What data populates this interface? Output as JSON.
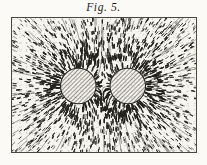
{
  "figure": {
    "caption": "Fig. 5.",
    "title": "Fig. 5.",
    "medium": "engraving",
    "paper_color": "#f7f5ef",
    "ink_color": "#20201c",
    "border_color": "#4a4740"
  },
  "plate": {
    "frame": {
      "x": 11,
      "y": 17,
      "width": 186,
      "height": 136,
      "border_width": 1
    },
    "background": "#f7f5ef"
  },
  "poles": [
    {
      "label": "left-pole",
      "cx": 78,
      "cy": 86,
      "r": 17.5,
      "fill_pattern": "diagonal-hatch",
      "hatch_color": "#3a3833",
      "outline_color": "#23221e"
    },
    {
      "label": "right-pole",
      "cx": 128,
      "cy": 86,
      "r": 17.5,
      "fill_pattern": "diagonal-hatch",
      "hatch_color": "#3a3833",
      "outline_color": "#23221e"
    }
  ],
  "field": {
    "description": "short dash strokes of iron filings arranged along magnetic lines of force",
    "stroke_color": "#23221e",
    "dash_count": 2400,
    "neutral_point": {
      "x": 103,
      "y": 86
    }
  },
  "chart_data": {
    "type": "scatter",
    "title": "Fig. 5.",
    "xlabel": "",
    "ylabel": "",
    "xlim": [
      0,
      186
    ],
    "ylim": [
      0,
      136
    ],
    "grid": false,
    "legend": false,
    "series": [
      {
        "name": "left pole",
        "kind": "disc",
        "x": [
          67
        ],
        "y": [
          69
        ],
        "radius": 17.5,
        "polarity": "like"
      },
      {
        "name": "right pole",
        "kind": "disc",
        "x": [
          117
        ],
        "y": [
          69
        ],
        "radius": 17.5,
        "polarity": "like"
      },
      {
        "name": "iron filings",
        "kind": "vector-field",
        "element": "dash",
        "count": 2400,
        "orientation": "tangent to field lines of two like magnetic poles"
      }
    ],
    "annotations": [
      {
        "text": "Fig. 5.",
        "x": 93,
        "y": -12,
        "style": "italic serif caption"
      }
    ]
  }
}
